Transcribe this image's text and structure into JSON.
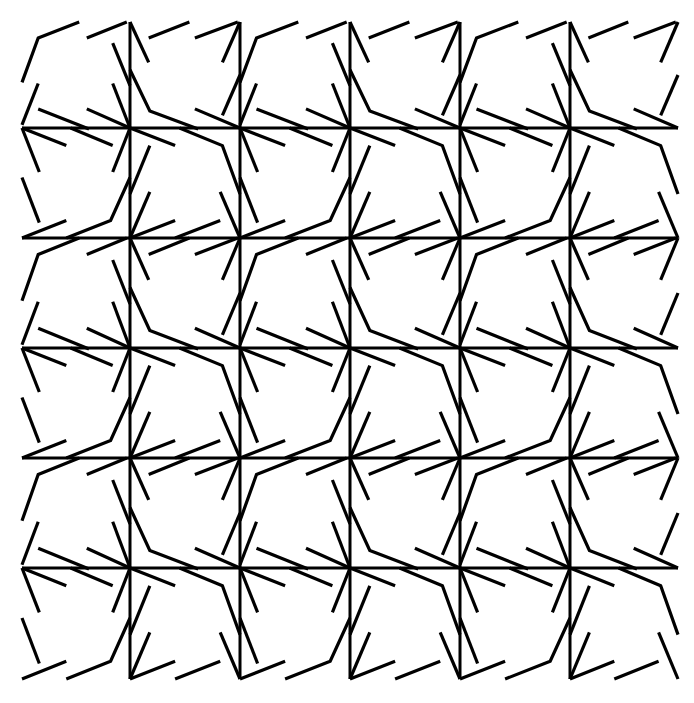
{
  "figure": {
    "grid_columns": 6,
    "grid_rows": 6,
    "ink_color": "#000000",
    "background_color": "#ffffff",
    "cell_type_layout": [
      [
        "A",
        "B",
        "A",
        "B",
        "A",
        "B"
      ],
      [
        "D",
        "C",
        "D",
        "C",
        "D",
        "C"
      ],
      [
        "A",
        "B",
        "A",
        "B",
        "A",
        "B"
      ],
      [
        "D",
        "C",
        "D",
        "C",
        "D",
        "C"
      ],
      [
        "A",
        "B",
        "A",
        "B",
        "A",
        "B"
      ],
      [
        "D",
        "C",
        "D",
        "C",
        "D",
        "C"
      ]
    ],
    "cell_motifs": {
      "A": [
        [
          [
            0,
            0.57
          ],
          [
            0.15,
            0.15
          ],
          [
            0.53,
            0
          ]
        ],
        [
          [
            0.6,
            0.15
          ],
          [
            0.97,
            0
          ]
        ],
        [
          [
            0.84,
            0.2
          ],
          [
            1,
            0.6
          ]
        ],
        [
          [
            0.84,
            0.58
          ],
          [
            1,
            1
          ]
        ],
        [
          [
            0.15,
            0.58
          ],
          [
            0,
            0.97
          ]
        ],
        [
          [
            0.15,
            0.82
          ],
          [
            0.62,
            1.01
          ]
        ],
        [
          [
            0.6,
            0.82
          ],
          [
            1,
            1
          ]
        ]
      ],
      "B": [
        [
          [
            0,
            0
          ],
          [
            0.17,
            0.38
          ]
        ],
        [
          [
            0.17,
            0.15
          ],
          [
            0.54,
            0
          ]
        ],
        [
          [
            0.59,
            0.15
          ],
          [
            0.98,
            0
          ]
        ],
        [
          [
            1,
            0
          ],
          [
            0.84,
            0.38
          ]
        ],
        [
          [
            0,
            0.45
          ],
          [
            0.18,
            0.84
          ],
          [
            0.62,
            1.01
          ]
        ],
        [
          [
            1,
            0.5
          ],
          [
            0.84,
            0.88
          ]
        ],
        [
          [
            0.59,
            0.82
          ],
          [
            1,
            1
          ]
        ]
      ],
      "C": [
        [
          [
            0,
            0
          ],
          [
            0.41,
            0.16
          ]
        ],
        [
          [
            0.45,
            0
          ],
          [
            0.84,
            0.16
          ],
          [
            1,
            0.6
          ]
        ],
        [
          [
            0.18,
            0.16
          ],
          [
            0,
            0.6
          ]
        ],
        [
          [
            0.18,
            0.58
          ],
          [
            0,
            1
          ]
        ],
        [
          [
            0,
            1
          ],
          [
            0.41,
            0.84
          ]
        ],
        [
          [
            0.41,
            1
          ],
          [
            0.82,
            0.84
          ]
        ],
        [
          [
            0.82,
            0.58
          ],
          [
            1,
            1
          ]
        ]
      ],
      "D": [
        [
          [
            0,
            0
          ],
          [
            0.41,
            0.16
          ]
        ],
        [
          [
            0.45,
            0
          ],
          [
            0.84,
            0.16
          ]
        ],
        [
          [
            0,
            0
          ],
          [
            0.16,
            0.4
          ]
        ],
        [
          [
            1,
            0
          ],
          [
            0.84,
            0.4
          ]
        ],
        [
          [
            0,
            0.45
          ],
          [
            0.16,
            0.86
          ]
        ],
        [
          [
            0,
            1
          ],
          [
            0.41,
            0.84
          ]
        ],
        [
          [
            0.41,
            1
          ],
          [
            0.82,
            0.84
          ],
          [
            1,
            0.45
          ]
        ]
      ]
    }
  }
}
